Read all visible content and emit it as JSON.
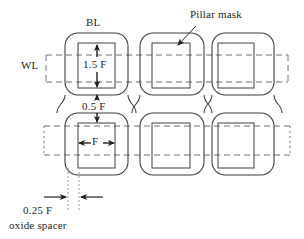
{
  "figure": {
    "type": "technical-layout-diagram",
    "colors": {
      "outline": "#3f3f44",
      "dashed": "#6f6f76",
      "dotted": "#9a9aa0",
      "text": "#231f20",
      "background": "#ffffff",
      "arrow": "#231f20"
    }
  },
  "labels": {
    "bl": "BL",
    "wl": "WL",
    "pillar_mask": "Pillar mask",
    "dim_vertical_pillar": "1.5 F",
    "dim_vertical_gap": "0.5 F",
    "dim_horizontal_pillar": "F",
    "dim_spacer": "0.25 F",
    "spacer_name": "oxide spacer"
  },
  "dimensions": [
    {
      "name": "pillar-height",
      "value": "1.5 F",
      "orientation": "vertical"
    },
    {
      "name": "cell-gap",
      "value": "0.5 F",
      "orientation": "vertical"
    },
    {
      "name": "pillar-width",
      "value": "F",
      "orientation": "horizontal"
    },
    {
      "name": "oxide-spacer-width",
      "value": "0.25 F",
      "orientation": "horizontal"
    }
  ],
  "structure": {
    "columns": 3,
    "rows": 2,
    "bitline_shape": "rounded-rectangle-chain",
    "wordline_shape": "dashed-horizontal-band",
    "pillar_shape": "square"
  }
}
